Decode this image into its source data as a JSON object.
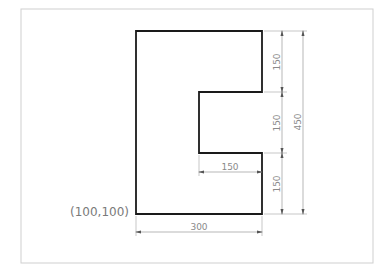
{
  "drawing": {
    "frame": {
      "x": 21,
      "y": 9,
      "width": 352,
      "height": 254,
      "stroke": "#cfcfcf"
    },
    "shape": {
      "description": "C-shaped polygon (rectangle with notch on right side)",
      "stroke": "#1a1a1a",
      "points": [
        [
          136,
          31
        ],
        [
          262,
          31
        ],
        [
          262,
          92
        ],
        [
          199,
          92
        ],
        [
          199,
          153
        ],
        [
          262,
          153
        ],
        [
          262,
          214
        ],
        [
          136,
          214
        ]
      ]
    },
    "origin_label": "(100,100)",
    "dimensions": {
      "top_segment": "150",
      "middle_segment": "150",
      "bottom_segment": "150",
      "total_height": "450",
      "notch_depth": "150",
      "base_width": "300"
    },
    "colors": {
      "dimension_line": "#9a9a9a",
      "dimension_text": "#8a8a8a",
      "shape_outline": "#1a1a1a"
    }
  }
}
